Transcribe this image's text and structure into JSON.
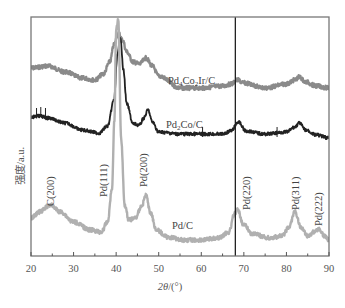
{
  "chart_data": {
    "type": "line",
    "title": "",
    "xlabel": "2θ/(°)",
    "ylabel": "强度/a.u.",
    "xlim": [
      20,
      90
    ],
    "xticks": [
      20,
      30,
      40,
      50,
      60,
      70,
      80,
      90
    ],
    "yticks": [],
    "grid": false,
    "legend": "inline labels",
    "reference_line": {
      "x": 68,
      "color": "#222222"
    },
    "series": [
      {
        "name": "Pd4Co2Ir/C",
        "label": "Pd4Co2Ir/C",
        "color": "#8a8a8a",
        "x": [
          20,
          24,
          28,
          32,
          35,
          37,
          38.5,
          39.5,
          40.5,
          41.5,
          42.5,
          44,
          45.5,
          47,
          48.5,
          50,
          55,
          60,
          65,
          67,
          68.5,
          70,
          75,
          80,
          82,
          83,
          84.5,
          87,
          90
        ],
        "y": [
          68,
          66,
          72,
          78,
          80,
          74,
          62,
          45,
          33,
          40,
          52,
          62,
          64,
          58,
          66,
          76,
          88,
          88,
          86,
          84,
          80,
          83,
          88,
          84,
          80,
          77,
          82,
          86,
          88
        ]
      },
      {
        "name": "Pd2Co/C",
        "label": "Pd2Co/C",
        "color": "#222222",
        "x": [
          20,
          22,
          24,
          28,
          32,
          36,
          38,
          39.5,
          40.3,
          41,
          41.7,
          42.5,
          44,
          45.5,
          46.5,
          47.5,
          48.5,
          50,
          55,
          60,
          65,
          67,
          68.7,
          70.5,
          75,
          80,
          82,
          83,
          84.5,
          87,
          90
        ],
        "y": [
          117,
          116,
          118,
          123,
          130,
          133,
          126,
          100,
          55,
          37,
          70,
          104,
          124,
          125,
          118,
          110,
          122,
          132,
          134,
          134,
          134,
          131,
          122,
          131,
          134,
          132,
          127,
          123,
          130,
          135,
          138
        ]
      },
      {
        "name": "Pd/C",
        "label": "Pd/C",
        "color": "#b0b0b0",
        "x": [
          20,
          22,
          24.5,
          27,
          30,
          34,
          36.5,
          38,
          39,
          39.6,
          40,
          40.5,
          41.2,
          42,
          43,
          44.5,
          46,
          47,
          48,
          49.5,
          52,
          56,
          60,
          64,
          66.5,
          67.8,
          68.5,
          70,
          72,
          76,
          79,
          80.5,
          82,
          83.5,
          85,
          86.5,
          87.5,
          89,
          90
        ],
        "y": [
          218,
          212,
          205,
          212,
          222,
          230,
          232,
          222,
          190,
          120,
          30,
          20,
          140,
          205,
          220,
          218,
          206,
          195,
          212,
          230,
          237,
          240,
          240,
          238,
          232,
          214,
          210,
          225,
          234,
          238,
          236,
          228,
          212,
          228,
          236,
          232,
          229,
          236,
          240
        ]
      }
    ],
    "annotations": [
      {
        "text": "C(200)",
        "x": 24.5,
        "rotation": -90
      },
      {
        "text": "Pd(111)",
        "x": 38.5,
        "rotation": -90
      },
      {
        "text": "Pd(200)",
        "x": 47,
        "rotation": -90
      },
      {
        "text": "Pd(220)",
        "x": 70,
        "rotation": -90
      },
      {
        "text": "Pd(311)",
        "x": 82,
        "rotation": -90
      },
      {
        "text": "Pd(222)",
        "x": 87.5,
        "rotation": -90
      }
    ]
  },
  "labels": {
    "xlabel": "2θ/(°)",
    "ylabel": "强度/a.u.",
    "series_pd4co2ir": "Pd4Co2Ir/C",
    "series_pd2co": "Pd2Co/C",
    "series_pdc": "Pd/C",
    "peak_c200": "C(200)",
    "peak_pd111": "Pd(111)",
    "peak_pd200": "Pd(200)",
    "peak_pd220": "Pd(220)",
    "peak_pd311": "Pd(311)",
    "peak_pd222": "Pd(222)"
  }
}
